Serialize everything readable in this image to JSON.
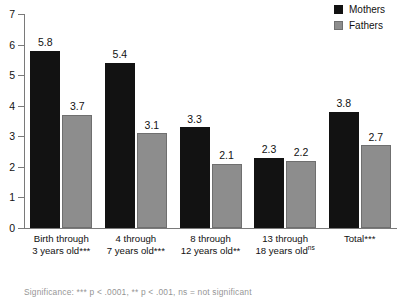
{
  "chart_data": {
    "type": "bar",
    "title": "",
    "subtitle": "",
    "xlabel": "",
    "ylabel": "",
    "ylim": [
      0,
      7
    ],
    "yticks": [
      0,
      1,
      2,
      3,
      4,
      5,
      6,
      7
    ],
    "grid": false,
    "legend_position": "top-right",
    "categories": [
      "Birth through 3 years old***",
      "4 through 7 years old***",
      "8 through 12 years old**",
      "13 through 18 years oldⁿˢ",
      "Total***"
    ],
    "category_lines": [
      {
        "line1": "Birth through",
        "line2": "3 years old",
        "sig": "***"
      },
      {
        "line1": "4 through",
        "line2": "7 years old",
        "sig": "***"
      },
      {
        "line1": "8 through",
        "line2": "12 years old",
        "sig": "**"
      },
      {
        "line1": "13 through",
        "line2": "18 years old",
        "sig": "ns"
      },
      {
        "line1": "Total",
        "line2": "",
        "sig": "***"
      }
    ],
    "series": [
      {
        "name": "Mothers",
        "color": "#121212",
        "values": [
          5.8,
          5.4,
          3.3,
          2.3,
          3.8
        ]
      },
      {
        "name": "Fathers",
        "color": "#8d8d8d",
        "values": [
          3.7,
          3.1,
          2.1,
          2.2,
          2.7
        ]
      }
    ],
    "value_labels": [
      "5.8",
      "3.7",
      "5.4",
      "3.1",
      "3.3",
      "2.1",
      "2.3",
      "2.2",
      "3.8",
      "2.7"
    ]
  },
  "legend": {
    "items": [
      {
        "label": "Mothers",
        "swatch": "mothers-swatch"
      },
      {
        "label": "Fathers",
        "swatch": "fathers-swatch"
      }
    ]
  },
  "footnote": {
    "text": "Significance:  *** p < .0001, ** p < .001, ns = not significant"
  }
}
